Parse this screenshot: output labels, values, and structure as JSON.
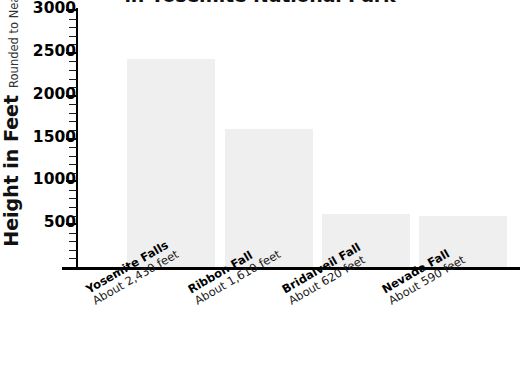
{
  "chart_data": {
    "type": "bar",
    "title": "in Yosemite National Park",
    "ylabel": "Height in Feet",
    "ylabel_sub": "Rounded to Nearest 10",
    "xlabel": "",
    "ylim": [
      0,
      3000
    ],
    "grid": false,
    "legend": null,
    "y_major_step": 500,
    "y_minor_step": 100,
    "tick_labels": [
      "3000",
      "2500",
      "2000",
      "1500",
      "1000",
      "500"
    ],
    "tick_values": [
      3000,
      2500,
      2000,
      1500,
      1000,
      500
    ],
    "categories": [
      "Yosemite Falls",
      "Ribbon Fall",
      "Bridalveil Fall",
      "Nevada Fall"
    ],
    "category_sublabels": [
      "About 2,430 feet",
      "About 1,610 feet",
      "About 620 feet",
      "About 590 feet"
    ],
    "values": [
      2430,
      1610,
      620,
      590
    ],
    "bar_color": "#efefef",
    "axis_color": "#000000",
    "text_color": "#111111"
  },
  "bars": [
    {
      "label": "Yosemite Falls",
      "sublabel": "About 2,430 feet",
      "value": 2430
    },
    {
      "label": "Ribbon Fall",
      "sublabel": "About 1,610 feet",
      "value": 1610
    },
    {
      "label": "Bridalveil Fall",
      "sublabel": "About 620 feet",
      "value": 620
    },
    {
      "label": "Nevada Fall",
      "sublabel": "About 590 feet",
      "value": 590
    }
  ],
  "axis": {
    "y_ticks": [
      {
        "label": "3000",
        "value": 3000
      },
      {
        "label": "2500",
        "value": 2500
      },
      {
        "label": "2000",
        "value": 2000
      },
      {
        "label": "1500",
        "value": 1500
      },
      {
        "label": "1000",
        "value": 1000
      },
      {
        "label": "500",
        "value": 500
      }
    ]
  }
}
